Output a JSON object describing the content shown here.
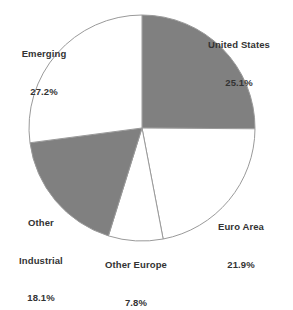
{
  "chart_data": {
    "type": "pie",
    "title": "",
    "subtitle": "",
    "xlabel": "",
    "ylabel": "",
    "legend_position": "none",
    "grid": false,
    "label_format": "name + percent",
    "start_angle_deg": 0,
    "direction": "clockwise",
    "total_percent": 100.1,
    "categories": [
      "United States",
      "Euro Area",
      "Other Europe",
      "Other Industrial",
      "Emerging"
    ],
    "values": [
      25.1,
      21.9,
      7.8,
      18.1,
      27.2
    ],
    "slices": [
      {
        "name": "United States",
        "value": 25.1,
        "value_label": "25.1%",
        "color": "#808080",
        "fill_style": "gray",
        "start_deg": 0.0,
        "end_deg": 90.4
      },
      {
        "name": "Euro Area",
        "value": 21.9,
        "value_label": "21.9%",
        "color": "#ffffff",
        "fill_style": "white",
        "start_deg": 90.4,
        "end_deg": 169.2
      },
      {
        "name": "Other Europe",
        "value": 7.8,
        "value_label": "7.8%",
        "color": "#ffffff",
        "fill_style": "white",
        "start_deg": 169.2,
        "end_deg": 197.3
      },
      {
        "name": "Other Industrial",
        "value": 18.1,
        "value_label": "18.1%",
        "color": "#808080",
        "fill_style": "gray",
        "start_deg": 197.3,
        "end_deg": 262.5
      },
      {
        "name": "Emerging",
        "value": 27.2,
        "value_label": "27.2%",
        "color": "#ffffff",
        "fill_style": "white",
        "start_deg": 262.5,
        "end_deg": 360.0
      }
    ]
  },
  "labels": {
    "united_states": {
      "name": "United States",
      "value": "25.1%"
    },
    "euro_area": {
      "name": "Euro Area",
      "value": "21.9%"
    },
    "other_europe": {
      "name": "Other Europe",
      "value": "7.8%"
    },
    "other_industrial": {
      "name_line1": "Other",
      "name_line2": "Industrial",
      "value": "18.1%"
    },
    "emerging": {
      "name": "Emerging",
      "value": "27.2%"
    }
  },
  "colors": {
    "slice_gray": "#808080",
    "slice_white": "#ffffff",
    "slice_outline": "#9a9a9a",
    "text": "#333333",
    "background": "#ffffff"
  },
  "geometry": {
    "center_x": 142,
    "center_y": 128,
    "radius": 113
  }
}
